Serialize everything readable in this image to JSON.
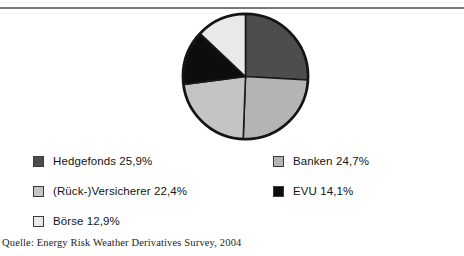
{
  "figure": {
    "caption_remnant": "",
    "rule_color": "#5d5d5d"
  },
  "chart_data": {
    "type": "pie",
    "title": "",
    "subtitle": "",
    "xlabel": "",
    "ylabel": "",
    "legend_position": "bottom",
    "grid": false,
    "start_angle_deg": 0,
    "direction": "clockwise",
    "total_percent": "100,0%",
    "categories": [
      "Hedgefonds",
      "Banken",
      "(Rück-)Versicherer",
      "EVU",
      "Börse"
    ],
    "values": [
      25.9,
      24.7,
      22.4,
      14.1,
      12.9
    ],
    "value_labels": [
      "25,9%",
      "24,7%",
      "22,4%",
      "14,1%",
      "12,9%"
    ],
    "colors": [
      "#4d4d4d",
      "#b4b4b4",
      "#c4c4c4",
      "#0d0d0d",
      "#e9e9e9"
    ],
    "slice_border_color": "#1a1a1a",
    "slices": [
      {
        "name": "Hedgefonds",
        "value": 25.9,
        "label": "Hedgefonds 25,9%",
        "color": "#4d4d4d",
        "start_deg": 0.0,
        "end_deg": 93.2
      },
      {
        "name": "Banken",
        "value": 24.7,
        "label": "Banken 24,7%",
        "color": "#b4b4b4",
        "start_deg": 93.2,
        "end_deg": 182.1
      },
      {
        "name": "(Rück-)Versicherer",
        "value": 22.4,
        "label": "(Rück-)Versicherer 22,4%",
        "color": "#c4c4c4",
        "start_deg": 182.1,
        "end_deg": 262.7
      },
      {
        "name": "EVU",
        "value": 14.1,
        "label": "EVU 14,1%",
        "color": "#0d0d0d",
        "start_deg": 262.7,
        "end_deg": 313.4
      },
      {
        "name": "Börse",
        "value": 12.9,
        "label": "Börse 12,9%",
        "color": "#e9e9e9",
        "start_deg": 313.4,
        "end_deg": 360.0
      }
    ]
  },
  "legend": {
    "left_column": [
      {
        "label": "Hedgefonds 25,9%",
        "color": "#4d4d4d"
      },
      {
        "label": "(Rück-)Versicherer 22,4%",
        "color": "#c4c4c4"
      },
      {
        "label": "Börse 12,9%",
        "color": "#e9e9e9"
      }
    ],
    "right_column": [
      {
        "label": "Banken 24,7%",
        "color": "#b4b4b4"
      },
      {
        "label": "EVU 14,1%",
        "color": "#0d0d0d"
      }
    ]
  },
  "source": {
    "text": "Quelle: Energy Risk Weather Derivatives Survey, 2004"
  }
}
